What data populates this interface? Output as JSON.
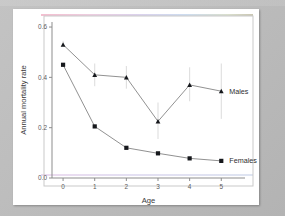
{
  "figure": {
    "background_color": "#ffffff",
    "mat_color": "#bdbdbd"
  },
  "chart_data": {
    "type": "line",
    "title": "",
    "subtitle": "",
    "xlabel": "Age",
    "ylabel": "Annual mortality rate",
    "x": [
      0,
      1,
      2,
      3,
      4,
      5
    ],
    "categories": [
      "0",
      "1",
      "2",
      "3",
      "4",
      "5"
    ],
    "xtick_labels": [
      "0",
      "1",
      "2",
      "3",
      "4",
      "5"
    ],
    "ytick_labels": [
      "0.0",
      "0.2",
      "0.4",
      "0.6"
    ],
    "ytick_values": [
      0.0,
      0.2,
      0.4,
      0.6
    ],
    "xlim": [
      -0.35,
      5.75
    ],
    "ylim": [
      0.0,
      0.62
    ],
    "grid": false,
    "legend_position": "inline-right",
    "series": [
      {
        "name": "Males",
        "marker": "triangle",
        "color": "#16181c",
        "values": [
          0.53,
          0.41,
          0.4,
          0.225,
          0.37,
          0.345
        ],
        "errors_low": [
          0.53,
          0.365,
          0.355,
          0.155,
          0.305,
          0.235
        ],
        "errors_high": [
          0.545,
          0.455,
          0.445,
          0.3,
          0.44,
          0.455
        ]
      },
      {
        "name": "Females",
        "marker": "square",
        "color": "#16181c",
        "values": [
          0.45,
          0.205,
          0.12,
          0.098,
          0.078,
          0.068
        ],
        "errors_low": [
          0.45,
          0.205,
          0.12,
          0.098,
          0.078,
          0.068
        ],
        "errors_high": [
          0.45,
          0.205,
          0.12,
          0.098,
          0.078,
          0.068
        ]
      }
    ],
    "annotations": [
      {
        "text": "Males",
        "x": 5.0,
        "y": 0.345
      },
      {
        "text": "Females",
        "x": 5.0,
        "y": 0.068
      }
    ]
  }
}
